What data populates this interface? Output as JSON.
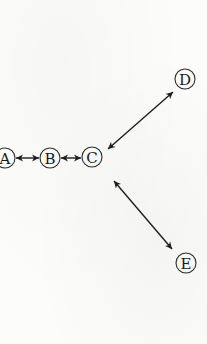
{
  "diagram": {
    "type": "graph",
    "background_color": "#fcfcfb",
    "nodes": [
      {
        "id": "A",
        "label": "A",
        "cx": 5,
        "cy": 158
      },
      {
        "id": "B",
        "label": "B",
        "cx": 50,
        "cy": 158
      },
      {
        "id": "C",
        "label": "C",
        "cx": 92,
        "cy": 157
      },
      {
        "id": "D",
        "label": "D",
        "cx": 185,
        "cy": 79
      },
      {
        "id": "E",
        "label": "E",
        "cx": 186,
        "cy": 263
      }
    ],
    "edges": [
      {
        "from": "A",
        "to": "B",
        "direction": "bidirectional"
      },
      {
        "from": "B",
        "to": "C",
        "direction": "bidirectional"
      },
      {
        "from": "C",
        "to": "D",
        "direction": "bidirectional"
      },
      {
        "from": "C",
        "to": "E",
        "direction": "bidirectional"
      }
    ]
  }
}
